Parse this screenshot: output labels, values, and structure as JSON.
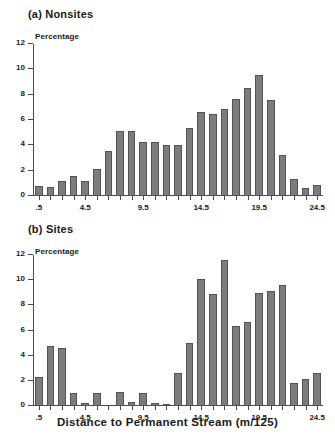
{
  "figure": {
    "xaxis_title": "Distance to Permanent Stream (m/125)"
  },
  "panels": [
    {
      "title": "(a) Nonsites",
      "ylabel": "Percentage"
    },
    {
      "title": "(b) Sites",
      "ylabel": "Percentage"
    }
  ],
  "chart_data": [
    {
      "type": "bar",
      "title": "(a) Nonsites",
      "xlabel": "Distance to Permanent Stream (m/125)",
      "ylabel": "Percentage",
      "categories": [
        ".5",
        "1.5",
        "2.5",
        "3.5",
        "4.5",
        "5.5",
        "6.5",
        "7.5",
        "8.5",
        "9.5",
        "10.5",
        "11.5",
        "12.5",
        "13.5",
        "14.5",
        "15.5",
        "16.5",
        "17.5",
        "18.5",
        "19.5",
        "20.5",
        "21.5",
        "22.5",
        "23.5",
        "24.5"
      ],
      "values": [
        0.8,
        0.75,
        1.2,
        1.6,
        1.2,
        2.15,
        3.55,
        5.15,
        5.15,
        4.3,
        4.3,
        4.05,
        4.05,
        5.35,
        6.65,
        6.5,
        6.9,
        7.65,
        8.55,
        9.55,
        7.6,
        3.25,
        1.35,
        0.6,
        0.85
      ],
      "ylim": [
        0,
        12
      ],
      "yticks": [
        0,
        2,
        4,
        6,
        8,
        10,
        12
      ],
      "ytick_labels": [
        "0",
        "2",
        "4",
        "6",
        "8",
        "10",
        "12"
      ],
      "xtick_labels": [
        ".5",
        "4.5",
        "9.5",
        "14.5",
        "19.5",
        "24.5"
      ],
      "xtick_positions": [
        0,
        4,
        9,
        14,
        19,
        24
      ],
      "grid": false,
      "legend": "none",
      "bar_color": "#7c7c7c",
      "bar_edge_color": "#535353"
    },
    {
      "type": "bar",
      "title": "(b) Sites",
      "xlabel": "Distance to Permanent Stream (m/125)",
      "ylabel": "Percentage",
      "categories": [
        ".5",
        "1.5",
        "2.5",
        "3.5",
        "4.5",
        "5.5",
        "6.5",
        "7.5",
        "8.5",
        "9.5",
        "10.5",
        "11.5",
        "12.5",
        "13.5",
        "14.5",
        "15.5",
        "16.5",
        "17.5",
        "18.5",
        "19.5",
        "20.5",
        "21.5",
        "22.5",
        "23.5",
        "24.5"
      ],
      "values": [
        2.3,
        4.8,
        4.6,
        1.05,
        0.2,
        1.05,
        0.0,
        1.15,
        0.35,
        1.0,
        0.25,
        0.15,
        2.6,
        5.0,
        10.1,
        8.9,
        11.6,
        6.35,
        6.7,
        9.0,
        9.15,
        9.6,
        1.8,
        2.15,
        2.6
      ],
      "ylim": [
        0,
        12
      ],
      "yticks": [
        0,
        2,
        4,
        6,
        8,
        10,
        12
      ],
      "ytick_labels": [
        "0",
        "2",
        "4",
        "6",
        "8",
        "10",
        "12"
      ],
      "xtick_labels": [
        ".5",
        "4.5",
        "9.5",
        "14.5",
        "19.5",
        "24.5"
      ],
      "xtick_positions": [
        0,
        4,
        9,
        14,
        19,
        24
      ],
      "grid": false,
      "legend": "none",
      "bar_color": "#7c7c7c",
      "bar_edge_color": "#535353"
    }
  ]
}
